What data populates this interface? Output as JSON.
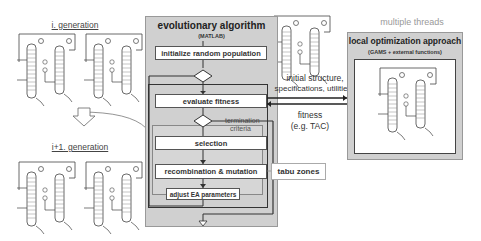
{
  "generations": {
    "top_label": "i. generation",
    "bottom_label": "i+1. generation"
  },
  "ea_panel": {
    "title": "evolutionary algorithm",
    "subtitle": "(MATLAB)",
    "steps": [
      {
        "label": "initialize random population"
      },
      {
        "label": "evaluate fitness"
      },
      {
        "label": "selection"
      },
      {
        "label": "recombination & mutation"
      },
      {
        "label": "adjust EA parameters"
      }
    ],
    "termination_label_1": "termination",
    "termination_label_2": "criteria"
  },
  "local_panel": {
    "header": "multiple threads",
    "title": "local optimization approach",
    "subtitle": "(GAMS + external functions)"
  },
  "connections": {
    "to_local": "initial structure,",
    "to_local_2": "specifications, utilities",
    "from_local": "fitness",
    "from_local_2": "(e.g. TAC)"
  },
  "tabu": {
    "label": "tabu zones"
  },
  "colors": {
    "panel_gray": "#d0d0d0",
    "line": "#333333"
  }
}
